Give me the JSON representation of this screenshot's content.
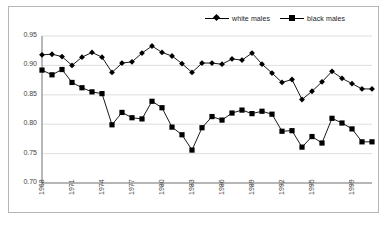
{
  "chart_data": {
    "type": "line",
    "title": "",
    "subtitle": "",
    "xlabel": "",
    "ylabel": "",
    "xlim": [
      1968,
      2001
    ],
    "ylim": [
      0.7,
      0.95
    ],
    "grid": true,
    "grid_axis": "y",
    "legend_position": "top-right",
    "x": [
      1968,
      1969,
      1970,
      1971,
      1972,
      1973,
      1974,
      1975,
      1976,
      1977,
      1978,
      1979,
      1980,
      1981,
      1982,
      1983,
      1984,
      1985,
      1986,
      1987,
      1988,
      1989,
      1990,
      1991,
      1992,
      1993,
      1994,
      1995,
      1996,
      1997,
      1998,
      1999,
      2000,
      2001
    ],
    "x_tick_labels": [
      "1968",
      "1971",
      "1974",
      "1977",
      "1980",
      "1983",
      "1986",
      "1989",
      "1992",
      "1995",
      "1999"
    ],
    "x_tick_values": [
      1968,
      1971,
      1974,
      1977,
      1980,
      1983,
      1986,
      1989,
      1992,
      1995,
      1999
    ],
    "y_tick_labels": [
      "0.95",
      "0.90",
      "0.85",
      "0.80",
      "0.75",
      "0.70"
    ],
    "y_tick_values": [
      0.95,
      0.9,
      0.85,
      0.8,
      0.75,
      0.7
    ],
    "series": [
      {
        "name": "white males",
        "marker": "diamond",
        "color": "#000000",
        "values": [
          0.918,
          0.919,
          0.915,
          0.9,
          0.914,
          0.922,
          0.914,
          0.888,
          0.904,
          0.906,
          0.921,
          0.933,
          0.922,
          0.916,
          0.903,
          0.888,
          0.904,
          0.904,
          0.902,
          0.911,
          0.909,
          0.921,
          0.902,
          0.887,
          0.871,
          0.876,
          0.842,
          0.856,
          0.872,
          0.89,
          0.878,
          0.869,
          0.86,
          0.86
        ]
      },
      {
        "name": "black males",
        "marker": "square",
        "color": "#000000",
        "values": [
          0.892,
          0.884,
          0.893,
          0.871,
          0.862,
          0.855,
          0.852,
          0.799,
          0.82,
          0.811,
          0.809,
          0.839,
          0.828,
          0.795,
          0.782,
          0.756,
          0.794,
          0.813,
          0.807,
          0.819,
          0.824,
          0.818,
          0.822,
          0.817,
          0.788,
          0.789,
          0.761,
          0.779,
          0.768,
          0.81,
          0.802,
          0.792,
          0.77,
          0.77
        ]
      }
    ]
  },
  "legend": {
    "entries": [
      {
        "label": "white males",
        "marker": "diamond"
      },
      {
        "label": "black males",
        "marker": "square"
      }
    ]
  }
}
